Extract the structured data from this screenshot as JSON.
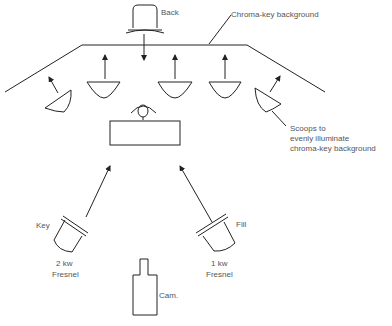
{
  "diagram": {
    "type": "studio-lighting-plot",
    "labels": {
      "back": "Back",
      "background": "Chroma-key background",
      "scoops_line1": "Scoops to",
      "scoops_line2": "evenly illuminate",
      "scoops_line3": "chroma-key background",
      "key": "Key",
      "key_spec1": "2 kw",
      "key_spec2": "Fresnel",
      "fill": "Fill",
      "fill_spec1": "1 kw",
      "fill_spec2": "Fresnel",
      "camera": "Cam."
    },
    "elements": [
      {
        "id": "back-light",
        "kind": "fresnel",
        "label": "Back"
      },
      {
        "id": "background",
        "kind": "cyclorama",
        "label": "Chroma-key background"
      },
      {
        "id": "scoop-1",
        "kind": "scoop"
      },
      {
        "id": "scoop-2",
        "kind": "scoop"
      },
      {
        "id": "scoop-3",
        "kind": "scoop"
      },
      {
        "id": "scoop-4",
        "kind": "scoop"
      },
      {
        "id": "scoop-5",
        "kind": "scoop"
      },
      {
        "id": "talent",
        "kind": "person"
      },
      {
        "id": "desk",
        "kind": "desk"
      },
      {
        "id": "key-light",
        "kind": "fresnel",
        "label": "Key",
        "spec": "2 kw Fresnel"
      },
      {
        "id": "fill-light",
        "kind": "fresnel",
        "label": "Fill",
        "spec": "1 kw Fresnel"
      },
      {
        "id": "camera",
        "kind": "camera",
        "label": "Cam."
      }
    ]
  }
}
